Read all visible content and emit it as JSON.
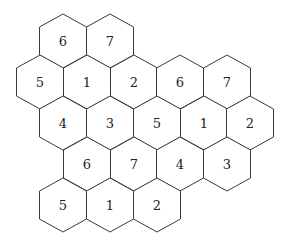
{
  "diagram": {
    "type": "hexagonal-tiling",
    "hex": {
      "half_width": 23.5,
      "half_height": 27,
      "shoulder": 14
    },
    "colors": {
      "stroke": "#3a3a3a",
      "fill": "#ffffff",
      "text": "#222222"
    },
    "cells": [
      {
        "label": "6",
        "cx": 63,
        "cy": 41
      },
      {
        "label": "7",
        "cx": 110,
        "cy": 41
      },
      {
        "label": "5",
        "cx": 40,
        "cy": 82
      },
      {
        "label": "1",
        "cx": 87,
        "cy": 82
      },
      {
        "label": "2",
        "cx": 134,
        "cy": 82
      },
      {
        "label": "6",
        "cx": 180,
        "cy": 82
      },
      {
        "label": "7",
        "cx": 227,
        "cy": 82
      },
      {
        "label": "4",
        "cx": 63,
        "cy": 123
      },
      {
        "label": "3",
        "cx": 110,
        "cy": 123
      },
      {
        "label": "5",
        "cx": 157,
        "cy": 123
      },
      {
        "label": "1",
        "cx": 204,
        "cy": 123
      },
      {
        "label": "2",
        "cx": 250,
        "cy": 123
      },
      {
        "label": "6",
        "cx": 87,
        "cy": 164
      },
      {
        "label": "7",
        "cx": 134,
        "cy": 164
      },
      {
        "label": "4",
        "cx": 180,
        "cy": 164
      },
      {
        "label": "3",
        "cx": 227,
        "cy": 164
      },
      {
        "label": "5",
        "cx": 63,
        "cy": 205
      },
      {
        "label": "1",
        "cx": 110,
        "cy": 205
      },
      {
        "label": "2",
        "cx": 157,
        "cy": 205
      }
    ]
  }
}
